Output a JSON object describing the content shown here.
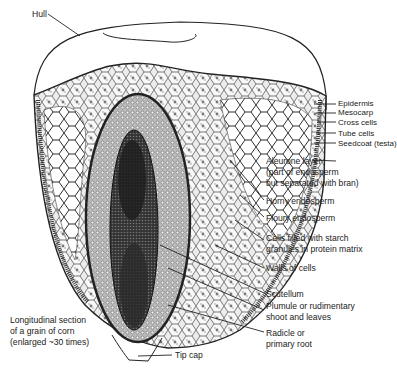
{
  "diagram": {
    "caption_lines": [
      "Longitudinal section",
      "of a grain of corn",
      "(enlarged ~30 times)"
    ],
    "labels": {
      "hull": "Hull",
      "epidermis": "Epidermis",
      "mesocarp": "Mesocarp",
      "cross_cells": "Cross cells",
      "tube_cells": "Tube cells",
      "seedcoat": "Seedcoat (testa)",
      "aleurone_lines": [
        "Aleurone layer",
        "(part of endosperm",
        "but separated with bran)"
      ],
      "horny_endosperm": "Horny endosperm",
      "floury_endosperm": "Floury endosperm",
      "starch_cells_lines": [
        "Cells filled with starch",
        "granules in protein matrix"
      ],
      "walls_of_cells": "Walls of cells",
      "scutellum": "Scutellum",
      "plumule_lines": [
        "Plumule or rudimentary",
        "shoot and leaves"
      ],
      "radicle_lines": [
        "Radicle or",
        "primary root"
      ],
      "tip_cap": "Tip cap"
    },
    "colors": {
      "line": "#222222",
      "germ_dark": "#2a2a2a",
      "germ_mid": "#6a6a6a",
      "endosperm_fill": "#d9d9d9",
      "background": "#ffffff"
    }
  }
}
